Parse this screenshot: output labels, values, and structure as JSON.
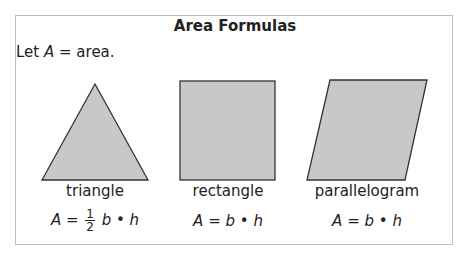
{
  "title": "Area Formulas",
  "intro": {
    "prefix": "Let ",
    "var": "A",
    "suffix": " = area."
  },
  "shapes": [
    {
      "name": "triangle",
      "formula": {
        "lhs": "A",
        "eq": " = ",
        "frac_num": "1",
        "frac_den": "2",
        "rhs": " b • h"
      }
    },
    {
      "name": "rectangle",
      "formula": {
        "text": "A = b • h"
      }
    },
    {
      "name": "parallelogram",
      "formula": {
        "text": "A = b • h"
      }
    }
  ],
  "colors": {
    "fill": "#c8c8c8",
    "stroke": "#333333",
    "border": "#bdbdbd"
  }
}
